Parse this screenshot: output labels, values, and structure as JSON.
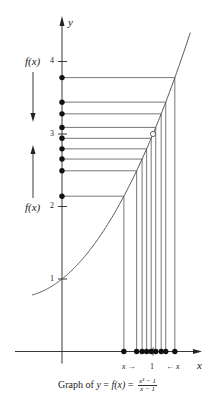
{
  "diagram": {
    "type": "function-graph-limit-illustration",
    "axes": {
      "x_label": "x",
      "y_label": "y",
      "y_ticks": [
        {
          "value": 1,
          "label": "1"
        },
        {
          "value": 2,
          "label": "2"
        },
        {
          "value": 3,
          "label": "3"
        },
        {
          "value": 4,
          "label": "4"
        }
      ],
      "x_ticks": [
        {
          "value": 1,
          "label": "1"
        }
      ]
    },
    "function": {
      "expression": "f(x) = (x^3 - 1)/(x - 1)",
      "simplified": "x^2 + x + 1",
      "hole": {
        "x": 1,
        "y": 3,
        "style": "open-circle"
      }
    },
    "sample_x_values": [
      0.68,
      0.82,
      0.88,
      0.93,
      0.98,
      1.03,
      1.09,
      1.14,
      1.24
    ],
    "annotations": {
      "left_upper_label": "f(x)",
      "left_upper_arrow": "down",
      "left_lower_label": "f(x)",
      "left_lower_arrow": "up",
      "x_from_left": "x →",
      "x_from_right": "← x"
    },
    "caption": {
      "prefix": "Graph of ",
      "y": "y",
      "eq1": " = ",
      "fx": "f(x)",
      "eq2": " = ",
      "numerator": "x³ − 1",
      "denominator": "x − 1"
    },
    "colors": {
      "ink": "#222222",
      "line": "#555555",
      "background": "#ffffff"
    }
  }
}
